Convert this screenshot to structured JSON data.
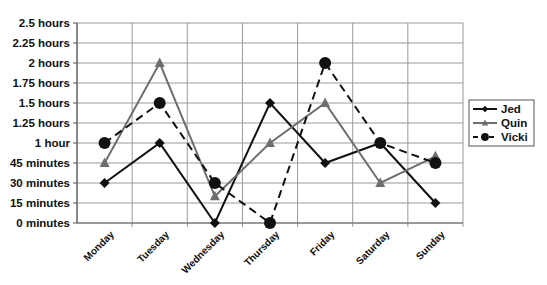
{
  "chart_data": {
    "type": "line",
    "title": "",
    "xlabel": "",
    "ylabel": "",
    "categories": [
      "Monday",
      "Tuesday",
      "Wednesday",
      "Thursday",
      "Friday",
      "Saturday",
      "Sunday"
    ],
    "y_unit": "minutes",
    "ylim": [
      0,
      150
    ],
    "y_ticks": [
      0,
      15,
      30,
      45,
      60,
      75,
      90,
      105,
      120,
      135,
      150
    ],
    "y_tick_labels": [
      "0 minutes",
      "15 minutes",
      "30 minutes",
      "45 minutes",
      "1 hour",
      "1.25 hours",
      "1.5 hours",
      "1.75 hours",
      "2 hours",
      "2.25 hours",
      "2.5 hours"
    ],
    "grid": true,
    "legend_position": "right",
    "series": [
      {
        "name": "Jed",
        "values": [
          30,
          60,
          0,
          90,
          45,
          60,
          15
        ],
        "marker": "diamond",
        "line": "solid",
        "color": "#111111"
      },
      {
        "name": "Quin",
        "values": [
          45,
          120,
          20,
          60,
          90,
          30,
          50
        ],
        "marker": "triangle",
        "line": "solid",
        "color": "#6e6e6e"
      },
      {
        "name": "Vicki",
        "values": [
          60,
          90,
          30,
          0,
          120,
          60,
          45
        ],
        "marker": "circle",
        "line": "dashed",
        "color": "#111111"
      }
    ]
  }
}
